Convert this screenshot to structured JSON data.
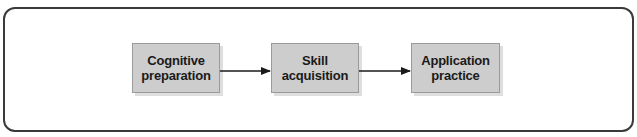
{
  "diagram": {
    "type": "flow",
    "direction": "left-to-right",
    "steps": [
      {
        "label": "Cognitive\npreparation"
      },
      {
        "label": "Skill\nacquisition"
      },
      {
        "label": "Application\npractice"
      }
    ],
    "connections": [
      {
        "from": 0,
        "to": 1
      },
      {
        "from": 1,
        "to": 2
      }
    ],
    "colors": {
      "box_fill": "#cdcdcd",
      "frame_stroke": "#3a3a3a",
      "arrow": "#1a1a1a",
      "text": "#1a1a1a"
    }
  }
}
